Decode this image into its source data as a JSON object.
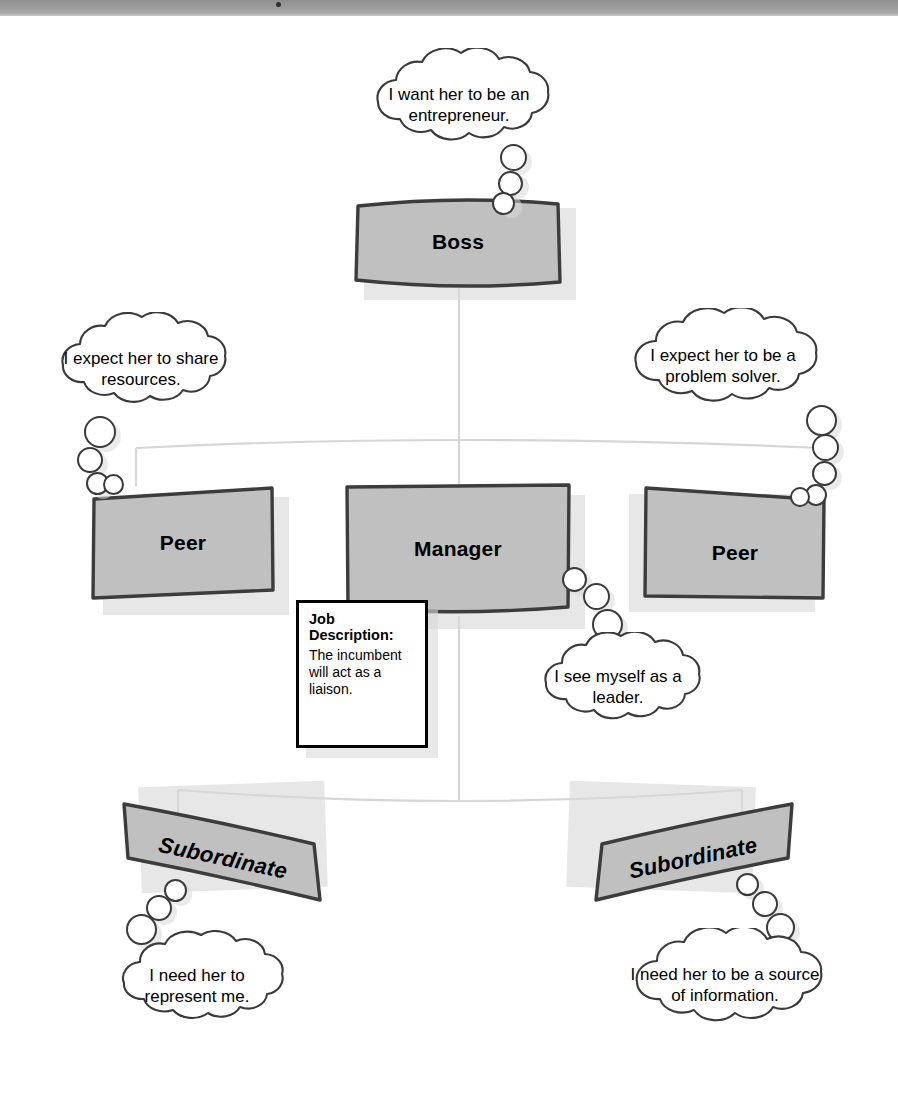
{
  "diagram": {
    "type": "organization-chart-with-thought-bubbles",
    "colors": {
      "node_fill": "#c0c0c0",
      "node_border": "#3c3c3c",
      "bubble_fill": "#ffffff",
      "bubble_stroke": "#3a3a3a",
      "connector": "#d4d4d4",
      "shadow": "#d9d9d9",
      "text": "#000000",
      "scan_band": "#9b9b9b"
    },
    "nodes": [
      {
        "id": "boss",
        "label": "Boss",
        "level": "superior"
      },
      {
        "id": "peer-left",
        "label": "Peer",
        "level": "lateral"
      },
      {
        "id": "manager",
        "label": "Manager",
        "level": "focal"
      },
      {
        "id": "peer-right",
        "label": "Peer",
        "level": "lateral"
      },
      {
        "id": "subordinate-left",
        "label": "Subordinate",
        "level": "report"
      },
      {
        "id": "subordinate-right",
        "label": "Subordinate",
        "level": "report"
      }
    ],
    "job_card": {
      "title": "Job\nDescription:",
      "body": "The incumbent will act as a liaison."
    },
    "bubbles": [
      {
        "id": "boss-thought",
        "owner": "boss",
        "text": "I want her to be an entrepreneur."
      },
      {
        "id": "peer-left-thought",
        "owner": "peer-left",
        "text": "I expect her to share resources."
      },
      {
        "id": "peer-right-thought",
        "owner": "peer-right",
        "text": "I expect her to be a problem solver."
      },
      {
        "id": "manager-thought",
        "owner": "manager",
        "text": "I see myself as a leader."
      },
      {
        "id": "subordinate-left-thought",
        "owner": "subordinate-left",
        "text": "I need her to represent me."
      },
      {
        "id": "subordinate-right-thought",
        "owner": "subordinate-right",
        "text": "I need her to be a source of information."
      }
    ]
  }
}
